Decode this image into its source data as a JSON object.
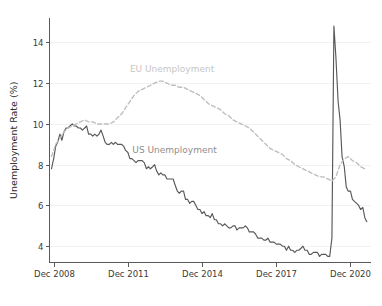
{
  "chart_data": {
    "type": "line",
    "title": "",
    "subtitle": "",
    "xlabel": "",
    "ylabel": "Unemployment Rate (%)",
    "ylim": [
      3.2,
      15.2
    ],
    "yticks": [
      4,
      6,
      8,
      10,
      12,
      14
    ],
    "ytick_labels": [
      "4",
      "6",
      "8",
      "10",
      "12",
      "14"
    ],
    "xlim": [
      2008.75,
      2021.75
    ],
    "xticks": [
      2008.92,
      2011.92,
      2014.92,
      2017.92,
      2020.92
    ],
    "xtick_labels": [
      "Dec 2008",
      "Dec 2011",
      "Dec 2014",
      "Dec 2017",
      "Dec 2020"
    ],
    "grid": "horizontal",
    "legend_position": "inline-annotations",
    "annotations": [
      {
        "name": "eu-series-annotation",
        "text": "EU Unemployment",
        "x": 2012.0,
        "y": 12.55,
        "color": "#c6c6c6"
      },
      {
        "name": "us-series-annotation",
        "text": "US Unemployment",
        "x": 2012.1,
        "y": 8.55,
        "color": "#8e8e8e"
      }
    ],
    "series": [
      {
        "name": "US Unemployment",
        "color": "#585858",
        "style": "solid",
        "x": [
          2008.83,
          2008.92,
          2009.0,
          2009.08,
          2009.17,
          2009.25,
          2009.33,
          2009.42,
          2009.5,
          2009.58,
          2009.67,
          2009.75,
          2009.83,
          2009.92,
          2010.0,
          2010.08,
          2010.17,
          2010.25,
          2010.33,
          2010.42,
          2010.5,
          2010.58,
          2010.67,
          2010.75,
          2010.83,
          2010.92,
          2011.0,
          2011.08,
          2011.17,
          2011.25,
          2011.33,
          2011.42,
          2011.5,
          2011.58,
          2011.67,
          2011.75,
          2011.83,
          2011.92,
          2012.0,
          2012.08,
          2012.17,
          2012.25,
          2012.33,
          2012.42,
          2012.5,
          2012.58,
          2012.67,
          2012.75,
          2012.83,
          2012.92,
          2013.0,
          2013.08,
          2013.17,
          2013.25,
          2013.33,
          2013.42,
          2013.5,
          2013.58,
          2013.67,
          2013.75,
          2013.83,
          2013.92,
          2014.0,
          2014.08,
          2014.17,
          2014.25,
          2014.33,
          2014.42,
          2014.5,
          2014.58,
          2014.67,
          2014.75,
          2014.83,
          2014.92,
          2015.0,
          2015.08,
          2015.17,
          2015.25,
          2015.33,
          2015.42,
          2015.5,
          2015.58,
          2015.67,
          2015.75,
          2015.83,
          2015.92,
          2016.0,
          2016.08,
          2016.17,
          2016.25,
          2016.33,
          2016.42,
          2016.5,
          2016.58,
          2016.67,
          2016.75,
          2016.83,
          2016.92,
          2017.0,
          2017.08,
          2017.17,
          2017.25,
          2017.33,
          2017.42,
          2017.5,
          2017.58,
          2017.67,
          2017.75,
          2017.83,
          2017.92,
          2018.0,
          2018.08,
          2018.17,
          2018.25,
          2018.33,
          2018.42,
          2018.5,
          2018.58,
          2018.67,
          2018.75,
          2018.83,
          2018.92,
          2019.0,
          2019.08,
          2019.17,
          2019.25,
          2019.33,
          2019.42,
          2019.5,
          2019.58,
          2019.67,
          2019.75,
          2019.83,
          2019.92,
          2020.0,
          2020.08,
          2020.17,
          2020.25,
          2020.33,
          2020.42,
          2020.5,
          2020.58,
          2020.67,
          2020.75,
          2020.83,
          2020.92,
          2021.0,
          2021.08,
          2021.17,
          2021.25,
          2021.33,
          2021.42,
          2021.5,
          2021.58
        ],
        "values": [
          7.8,
          8.3,
          8.9,
          9.1,
          9.5,
          9.2,
          9.6,
          9.8,
          9.8,
          9.9,
          10.0,
          9.9,
          9.9,
          9.8,
          9.8,
          9.7,
          9.8,
          9.9,
          9.5,
          9.5,
          9.4,
          9.5,
          9.4,
          9.5,
          9.7,
          9.4,
          9.1,
          9.0,
          9.0,
          9.1,
          9.0,
          9.1,
          9.0,
          9.0,
          9.0,
          8.9,
          8.7,
          8.6,
          8.3,
          8.3,
          8.2,
          8.1,
          8.2,
          8.2,
          8.2,
          8.1,
          7.8,
          7.9,
          7.8,
          7.9,
          8.0,
          7.7,
          7.5,
          7.6,
          7.5,
          7.5,
          7.3,
          7.3,
          7.3,
          7.3,
          7.0,
          6.7,
          6.6,
          6.7,
          6.7,
          6.3,
          6.3,
          6.1,
          6.2,
          6.2,
          6.0,
          5.8,
          5.8,
          5.6,
          5.7,
          5.5,
          5.5,
          5.4,
          5.6,
          5.3,
          5.3,
          5.1,
          5.1,
          5.0,
          5.1,
          5.0,
          4.9,
          4.9,
          5.0,
          5.0,
          4.8,
          4.9,
          4.9,
          4.9,
          5.0,
          4.9,
          4.7,
          4.7,
          4.7,
          4.6,
          4.4,
          4.4,
          4.4,
          4.3,
          4.3,
          4.4,
          4.2,
          4.2,
          4.2,
          4.1,
          4.1,
          4.1,
          4.0,
          4.0,
          3.8,
          4.0,
          3.8,
          3.8,
          3.7,
          3.8,
          3.8,
          3.9,
          4.0,
          3.8,
          3.8,
          3.6,
          3.6,
          3.7,
          3.7,
          3.7,
          3.5,
          3.6,
          3.6,
          3.6,
          3.5,
          3.5,
          4.4,
          14.8,
          13.3,
          11.1,
          10.2,
          8.4,
          7.9,
          6.9,
          6.7,
          6.7,
          6.3,
          6.2,
          6.1,
          6.0,
          5.8,
          5.9,
          5.4,
          5.2
        ]
      },
      {
        "name": "EU Unemployment",
        "color": "#bdbdbd",
        "style": "dashed",
        "x": [
          2008.83,
          2008.92,
          2009.0,
          2009.17,
          2009.33,
          2009.5,
          2009.67,
          2009.83,
          2010.0,
          2010.17,
          2010.33,
          2010.5,
          2010.67,
          2010.83,
          2011.0,
          2011.17,
          2011.33,
          2011.5,
          2011.67,
          2011.83,
          2012.0,
          2012.17,
          2012.33,
          2012.5,
          2012.67,
          2012.83,
          2013.0,
          2013.17,
          2013.33,
          2013.5,
          2013.67,
          2013.83,
          2014.0,
          2014.17,
          2014.33,
          2014.5,
          2014.67,
          2014.83,
          2015.0,
          2015.17,
          2015.33,
          2015.5,
          2015.67,
          2015.83,
          2016.0,
          2016.17,
          2016.33,
          2016.5,
          2016.67,
          2016.83,
          2017.0,
          2017.17,
          2017.33,
          2017.5,
          2017.67,
          2017.83,
          2018.0,
          2018.17,
          2018.33,
          2018.5,
          2018.67,
          2018.83,
          2019.0,
          2019.17,
          2019.33,
          2019.5,
          2019.67,
          2019.83,
          2020.0,
          2020.17,
          2020.33,
          2020.5,
          2020.67,
          2020.83,
          2021.0,
          2021.17,
          2021.33,
          2021.5,
          2021.58
        ],
        "values": [
          8.4,
          8.7,
          9.0,
          9.3,
          9.6,
          9.8,
          9.9,
          10.0,
          10.1,
          10.2,
          10.1,
          10.1,
          10.0,
          10.0,
          10.0,
          10.0,
          10.1,
          10.3,
          10.5,
          10.8,
          11.1,
          11.4,
          11.6,
          11.7,
          11.8,
          11.9,
          12.0,
          12.1,
          12.1,
          12.0,
          11.9,
          11.9,
          11.8,
          11.8,
          11.7,
          11.6,
          11.5,
          11.4,
          11.2,
          11.0,
          10.9,
          10.8,
          10.7,
          10.5,
          10.4,
          10.2,
          10.1,
          10.0,
          9.9,
          9.8,
          9.6,
          9.4,
          9.2,
          9.0,
          8.8,
          8.7,
          8.6,
          8.5,
          8.3,
          8.2,
          8.0,
          7.9,
          7.8,
          7.7,
          7.6,
          7.5,
          7.4,
          7.4,
          7.3,
          7.2,
          7.4,
          8.0,
          8.3,
          8.4,
          8.2,
          8.1,
          7.9,
          7.8,
          7.8
        ]
      }
    ]
  }
}
